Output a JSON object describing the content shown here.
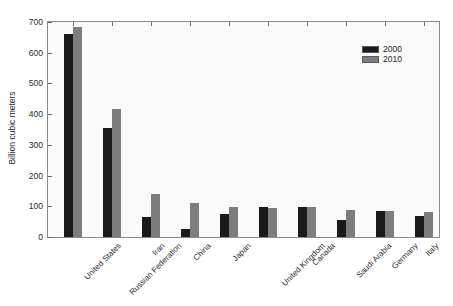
{
  "chart_data": {
    "type": "bar",
    "title": "",
    "xlabel": "",
    "ylabel": "Billion cubic meters",
    "ylim": [
      0,
      700
    ],
    "yticks": [
      0,
      100,
      200,
      300,
      400,
      500,
      600,
      700
    ],
    "grid": false,
    "legend_position": "top-right",
    "categories": [
      "United States",
      "Russian Federation",
      "Iran",
      "China",
      "Japan",
      "United Kingdom",
      "Canada",
      "Saudi Arabia",
      "Germany",
      "Italy"
    ],
    "series": [
      {
        "name": "2000",
        "color": "#1a1a1a",
        "values": [
          660,
          355,
          65,
          27,
          75,
          99,
          97,
          54,
          85,
          69
        ]
      },
      {
        "name": "2010",
        "color": "#7d7d7d",
        "values": [
          683,
          416,
          139,
          112,
          98,
          96,
          97,
          88,
          86,
          82
        ]
      }
    ]
  },
  "axes": {
    "y_label": "Billion cubic meters",
    "y_tick_labels": [
      "0",
      "100",
      "200",
      "300",
      "400",
      "500",
      "600",
      "700"
    ]
  },
  "legend": {
    "entries": [
      {
        "label": "2000",
        "color": "#1a1a1a"
      },
      {
        "label": "2010",
        "color": "#7d7d7d"
      }
    ]
  }
}
